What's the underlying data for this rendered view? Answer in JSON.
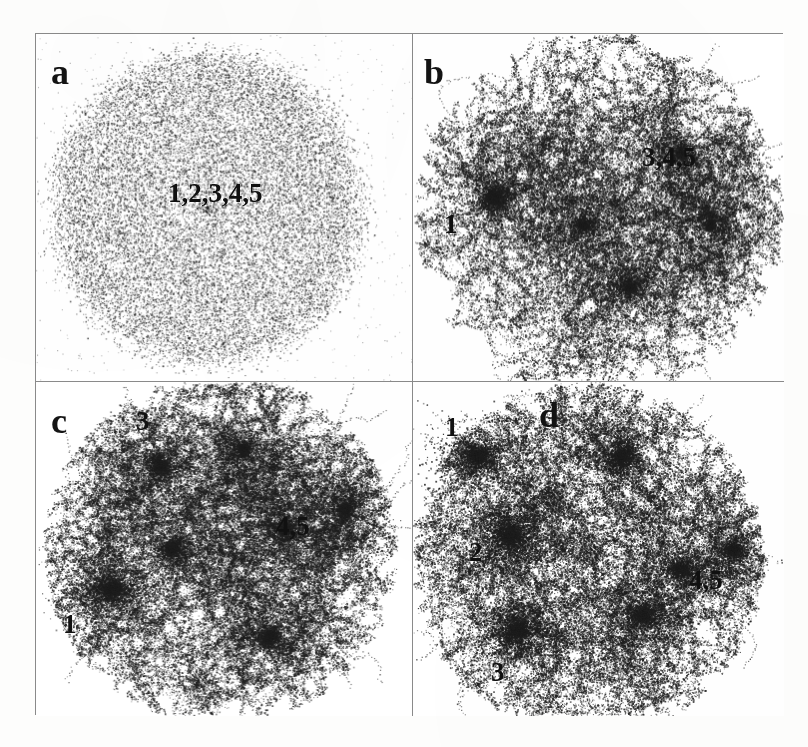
{
  "figure": {
    "caption_letters": [
      "a",
      "b",
      "c",
      "d"
    ],
    "background_color": "#ffffff",
    "point_color": "#1f1f1f",
    "frame_color": "#8a8a8a"
  },
  "panels": [
    {
      "id": "a",
      "letter": "a",
      "description": "uniform random point distribution filling a disc",
      "labels": [
        {
          "text": "1,2,3,4,5",
          "x_pct": 44.0,
          "y_pct": 44.0
        }
      ]
    },
    {
      "id": "b",
      "letter": "b",
      "description": "early clustering, filamentary web with one dense knot",
      "labels": [
        {
          "text": "3,4,5",
          "x_pct": 72.0,
          "y_pct": 34.0
        },
        {
          "text": "1",
          "x_pct": 8.0,
          "y_pct": 54.0
        }
      ]
    },
    {
      "id": "c",
      "letter": "c",
      "description": "intermediate clustering, several merged knots and voids",
      "labels": [
        {
          "text": "3",
          "x_pct": 27.0,
          "y_pct": 8.0
        },
        {
          "text": "4,5",
          "x_pct": 65.0,
          "y_pct": 41.0
        },
        {
          "text": "1",
          "x_pct": 8.0,
          "y_pct": 70.0
        }
      ]
    },
    {
      "id": "d",
      "letter": "d",
      "description": "late clustering, strong filaments, large voids and distinct groups",
      "labels": [
        {
          "text": "1",
          "x_pct": 8.0,
          "y_pct": 8.0
        },
        {
          "text": "2",
          "x_pct": 15.0,
          "y_pct": 45.0
        },
        {
          "text": "3",
          "x_pct": 21.0,
          "y_pct": 81.0
        },
        {
          "text": "4,5",
          "x_pct": 74.0,
          "y_pct": 54.0
        }
      ]
    }
  ],
  "chart_data": {
    "type": "scatter",
    "title": "",
    "xlabel": "",
    "ylabel": "",
    "grid": false,
    "legend": "none",
    "panel_count": 4,
    "panel_layout": "2x2",
    "series": [
      {
        "name": "a",
        "n_points": 22000,
        "structure": "uniform disc",
        "cluster_labels": [
          "1,2,3,4,5"
        ],
        "cluster_centers": [
          [
            0.44,
            0.44
          ]
        ]
      },
      {
        "name": "b",
        "n_points": 16000,
        "structure": "filamentary web, one dominant knot at left",
        "cluster_labels": [
          "1",
          "3,4,5"
        ],
        "cluster_centers": [
          [
            0.22,
            0.47
          ],
          [
            0.72,
            0.34
          ]
        ]
      },
      {
        "name": "c",
        "n_points": 16000,
        "structure": "merged knots with voids",
        "cluster_labels": [
          "1",
          "3",
          "4,5"
        ],
        "cluster_centers": [
          [
            0.2,
            0.62
          ],
          [
            0.33,
            0.25
          ],
          [
            0.66,
            0.44
          ]
        ]
      },
      {
        "name": "d",
        "n_points": 15000,
        "structure": "strong filaments, distinct groups, large voids",
        "cluster_labels": [
          "1",
          "2",
          "3",
          "4,5"
        ],
        "cluster_centers": [
          [
            0.17,
            0.22
          ],
          [
            0.26,
            0.46
          ],
          [
            0.28,
            0.74
          ],
          [
            0.72,
            0.56
          ]
        ]
      }
    ]
  }
}
